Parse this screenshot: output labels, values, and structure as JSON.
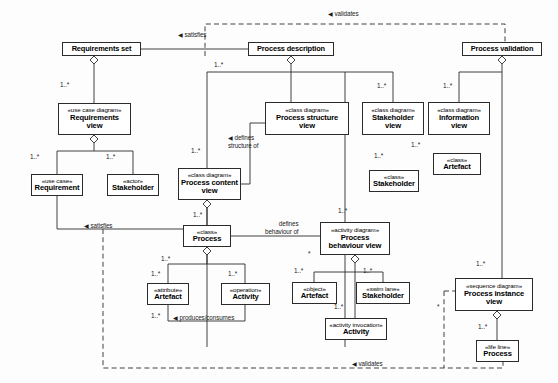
{
  "diagram": {
    "type": "uml-class-diagram",
    "colors": {
      "line": "#2b2b2b",
      "box_fill": "#ffffff",
      "text": "#000000",
      "background": "#fdfdfd"
    },
    "nodes": [
      {
        "id": "requirements-set",
        "stereotype": "",
        "name": "Requirements set",
        "x": 62,
        "y": 42,
        "w": 79,
        "h": 14
      },
      {
        "id": "process-description",
        "stereotype": "",
        "name": "Process description",
        "x": 248,
        "y": 42,
        "w": 86,
        "h": 14
      },
      {
        "id": "process-validation",
        "stereotype": "",
        "name": "Process validation",
        "x": 462,
        "y": 42,
        "w": 80,
        "h": 14
      },
      {
        "id": "requirements-view",
        "stereotype": "«use case diagram»",
        "name": "Requirements\nview",
        "x": 58,
        "y": 103,
        "w": 73,
        "h": 32
      },
      {
        "id": "process-structure-view",
        "stereotype": "«class diagram»",
        "name": "Process structure\nview",
        "x": 265,
        "y": 102,
        "w": 84,
        "h": 33
      },
      {
        "id": "stakeholder-view",
        "stereotype": "«class diagram»",
        "name": "Stakeholder\nview",
        "x": 362,
        "y": 102,
        "w": 62,
        "h": 33
      },
      {
        "id": "information-view",
        "stereotype": "«class diagram»",
        "name": "Information\nview",
        "x": 428,
        "y": 102,
        "w": 62,
        "h": 33
      },
      {
        "id": "requirement",
        "stereotype": "«use case»",
        "name": "Requirement",
        "x": 31,
        "y": 174,
        "w": 52,
        "h": 22
      },
      {
        "id": "stakeholder-actor",
        "stereotype": "«actor»",
        "name": "Stakeholder",
        "x": 107,
        "y": 174,
        "w": 52,
        "h": 22
      },
      {
        "id": "process-content-view",
        "stereotype": "«class diagram»",
        "name": "Process content\nview",
        "x": 178,
        "y": 168,
        "w": 63,
        "h": 32
      },
      {
        "id": "artefact-info",
        "stereotype": "«class»",
        "name": "Artefact",
        "x": 433,
        "y": 153,
        "w": 48,
        "h": 22
      },
      {
        "id": "stakeholder-class",
        "stereotype": "«class»",
        "name": "Stakeholder",
        "x": 369,
        "y": 170,
        "w": 50,
        "h": 22
      },
      {
        "id": "process-class",
        "stereotype": "«class»",
        "name": "Process",
        "x": 183,
        "y": 225,
        "w": 48,
        "h": 22
      },
      {
        "id": "process-behaviour-view",
        "stereotype": "«activity diagram»",
        "name": "Process\nbehaviour view",
        "x": 320,
        "y": 222,
        "w": 70,
        "h": 33
      },
      {
        "id": "process-instance-view",
        "stereotype": "«sequence diagram»",
        "name": "Process instance\nview",
        "x": 455,
        "y": 278,
        "w": 78,
        "h": 33
      },
      {
        "id": "artefact-attribute",
        "stereotype": "«attribute»",
        "name": "Artefact",
        "x": 147,
        "y": 283,
        "w": 42,
        "h": 22
      },
      {
        "id": "activity-operation",
        "stereotype": "«operation»",
        "name": "Activity",
        "x": 221,
        "y": 283,
        "w": 49,
        "h": 22
      },
      {
        "id": "artefact-object",
        "stereotype": "«object»",
        "name": "Artefact",
        "x": 292,
        "y": 282,
        "w": 45,
        "h": 22
      },
      {
        "id": "stakeholder-swimlane",
        "stereotype": "«swim lane»",
        "name": "Stakeholder",
        "x": 356,
        "y": 282,
        "w": 54,
        "h": 22
      },
      {
        "id": "activity-invocation",
        "stereotype": "«activity invocation»",
        "name": "Activity",
        "x": 325,
        "y": 318,
        "w": 62,
        "h": 22
      },
      {
        "id": "process-lifeline",
        "stereotype": "«life line»",
        "name": "Process",
        "x": 476,
        "y": 340,
        "w": 43,
        "h": 22
      }
    ],
    "association_labels": [
      {
        "id": "lbl-satisfies-top",
        "text": "satisfies",
        "arrow": "◀",
        "x": 178,
        "y": 33
      },
      {
        "id": "lbl-validates-top",
        "text": "validates",
        "arrow": "◀",
        "x": 328,
        "y": 11
      },
      {
        "id": "lbl-satisfies-mid",
        "text": "satisfies",
        "arrow": "◀",
        "x": 84,
        "y": 224
      },
      {
        "id": "lbl-validates-bottom",
        "text": "validates",
        "arrow": "◀",
        "x": 352,
        "y": 355
      },
      {
        "id": "lbl-defines-structure",
        "text": "defines\nstructure of",
        "arrow": "◀",
        "x": 228,
        "y": 136
      },
      {
        "id": "lbl-defines-behaviour",
        "text": "defines\nbehaviour of",
        "arrow": "",
        "x": 267,
        "y": 222
      },
      {
        "id": "lbl-produces",
        "text": "produces/consumes",
        "arrow": "◀",
        "x": 173,
        "y": 308
      }
    ],
    "multiplicity_labels": [
      {
        "id": "m-reqset-reqview",
        "text": "1..*",
        "x": 60,
        "y": 81
      },
      {
        "id": "m-procdesc-left",
        "text": "1..*",
        "x": 214,
        "y": 61
      },
      {
        "id": "m-stakeholderview",
        "text": "1..*",
        "x": 377,
        "y": 82
      },
      {
        "id": "m-informationview",
        "text": "1..*",
        "x": 443,
        "y": 82
      },
      {
        "id": "m-reqview-requirement",
        "text": "1..*",
        "x": 30,
        "y": 153
      },
      {
        "id": "m-reqview-stakeholder",
        "text": "1..*",
        "x": 106,
        "y": 153
      },
      {
        "id": "m-proccontentview",
        "text": "1..*",
        "x": 191,
        "y": 147
      },
      {
        "id": "m-stakeholderview-class",
        "text": "1..*",
        "x": 374,
        "y": 152
      },
      {
        "id": "m-infoview-artefact",
        "text": "1..*",
        "x": 411,
        "y": 141
      },
      {
        "id": "m-proccontent-process",
        "text": "1..*",
        "x": 193,
        "y": 211
      },
      {
        "id": "m-process-children",
        "text": "1..*",
        "x": 161,
        "y": 255
      },
      {
        "id": "m-process-attribute",
        "text": "1..*",
        "x": 151,
        "y": 270
      },
      {
        "id": "m-process-operation",
        "text": "1..*",
        "x": 228,
        "y": 270
      },
      {
        "id": "m-artefact-produces",
        "text": "1..*",
        "x": 151,
        "y": 312
      },
      {
        "id": "m-procbehav-top",
        "text": "1..*",
        "x": 338,
        "y": 207
      },
      {
        "id": "m-procbehav-object",
        "text": "1..*",
        "x": 294,
        "y": 267
      },
      {
        "id": "m-procbehav-swimlane",
        "text": "1..*",
        "x": 363,
        "y": 267
      },
      {
        "id": "m-object-activity",
        "text": "1..*",
        "x": 334,
        "y": 303
      },
      {
        "id": "m-procinstview",
        "text": "1..*",
        "x": 476,
        "y": 260
      },
      {
        "id": "m-lifeline",
        "text": "1..*",
        "x": 478,
        "y": 323
      },
      {
        "id": "m-star-behaviour",
        "text": "*",
        "x": 308,
        "y": 252
      },
      {
        "id": "m-star-instance",
        "text": "*",
        "x": 437,
        "y": 305
      }
    ]
  }
}
